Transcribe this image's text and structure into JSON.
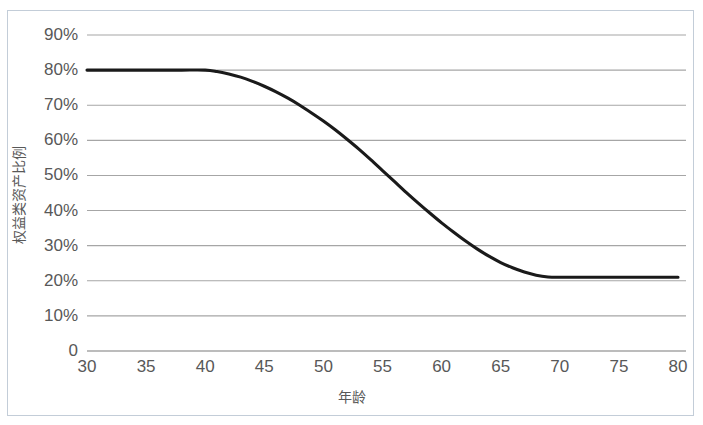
{
  "chart_data": {
    "type": "line",
    "title": "",
    "xlabel": "年龄",
    "ylabel": "权益类资产比例",
    "xlim": [
      30,
      80
    ],
    "ylim": [
      0,
      0.9
    ],
    "grid": true,
    "legend": "none",
    "line_color": "#1a1a1a",
    "grid_color": "#a6a6a6",
    "x_ticks": [
      "30",
      "35",
      "40",
      "45",
      "50",
      "55",
      "60",
      "65",
      "70",
      "75",
      "80"
    ],
    "y_ticks": [
      "0",
      "10%",
      "20%",
      "30%",
      "40%",
      "50%",
      "60%",
      "70%",
      "80%",
      "90%"
    ],
    "x_tick_values": [
      30,
      35,
      40,
      45,
      50,
      55,
      60,
      65,
      70,
      75,
      80
    ],
    "y_tick_values": [
      0,
      10,
      20,
      30,
      40,
      50,
      60,
      70,
      75,
      80,
      90
    ],
    "series": [
      {
        "name": "权益类资产比例",
        "x": [
          30,
          32,
          34,
          36,
          38,
          40,
          41,
          42,
          43,
          44,
          45,
          46,
          47,
          48,
          49,
          50,
          51,
          52,
          53,
          54,
          55,
          56,
          57,
          58,
          59,
          60,
          61,
          62,
          63,
          64,
          65,
          66,
          67,
          68,
          69,
          70,
          72,
          74,
          76,
          78,
          80
        ],
        "values": [
          80,
          80,
          80,
          80,
          80,
          80,
          79.6,
          78.9,
          78.0,
          76.8,
          75.4,
          73.8,
          72.0,
          70.0,
          67.8,
          65.5,
          63.0,
          60.3,
          57.5,
          54.5,
          51.4,
          48.3,
          45.2,
          42.2,
          39.3,
          36.5,
          33.9,
          31.4,
          29.1,
          27.0,
          25.2,
          23.7,
          22.5,
          21.6,
          21.1,
          21.0,
          21.0,
          21.0,
          21.0,
          21.0,
          21.0
        ]
      }
    ],
    "annotations": {
      "plateau_high": "80%",
      "plateau_low": "21%",
      "decline_start_age": "40",
      "decline_end_age": "69"
    }
  },
  "axis": {
    "y_label_text": "权益类资产比例",
    "x_label_text": "年龄"
  }
}
